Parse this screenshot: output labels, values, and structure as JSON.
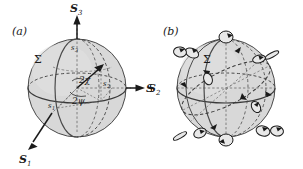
{
  "figure": {
    "background_color": "#ffffff",
    "ink_color": "#1a1a1a",
    "sphere_fill": "#d8d8d8",
    "sphere_stroke": "#4a4a4a",
    "dashed_stroke": "#3a3a3a",
    "dotted_stroke": "#6a6a6a"
  },
  "panel_a": {
    "label": "(a)",
    "surface_label": "Σ",
    "axes": [
      {
        "name": "s3-axis",
        "label": "S",
        "subscript": "3",
        "direction": "up"
      },
      {
        "name": "s2-axis",
        "label": "S",
        "subscript": "2",
        "direction": "right"
      },
      {
        "name": "s1-axis",
        "label": "S",
        "subscript": "1",
        "direction": "lower-left"
      }
    ],
    "component_labels": [
      {
        "name": "s3-component",
        "label": "s",
        "subscript": "3"
      },
      {
        "name": "s2-component",
        "label": "s",
        "subscript": "2"
      },
      {
        "name": "s1-component",
        "label": "s",
        "subscript": "1"
      }
    ],
    "angles": [
      {
        "name": "angle-2chi",
        "label": "2χ"
      },
      {
        "name": "angle-2psi",
        "label": "2ψ"
      }
    ],
    "sphere": {
      "cx": 77,
      "cy": 88,
      "r": 49
    },
    "state_point": {
      "x": 101,
      "y": 67
    }
  },
  "panel_b": {
    "label": "(b)",
    "surface_label": "Σ",
    "sphere": {
      "cx": 226,
      "cy": 88,
      "r": 49
    },
    "axis_fragment": {
      "label": "S",
      "subscript": "2"
    },
    "markers": [
      {
        "name": "polarization-circular-north",
        "type": "circle",
        "cx": 226,
        "cy": 37,
        "rx": 7.0,
        "ry": 6.0,
        "rot": 0
      },
      {
        "name": "polarization-circular-south",
        "type": "circle",
        "cx": 226,
        "cy": 140,
        "rx": 7.0,
        "ry": 6.0,
        "rot": 0
      },
      {
        "name": "polarization-linear-west",
        "type": "linear",
        "cx": 180,
        "cy": 136,
        "rx": 7.5,
        "ry": 2.2,
        "rot": -30
      },
      {
        "name": "polarization-linear-east",
        "type": "linear",
        "cx": 272,
        "cy": 55,
        "rx": 7.5,
        "ry": 2.2,
        "rot": -28
      },
      {
        "name": "polarization-ellipse-nw",
        "type": "ellipse",
        "cx": 192,
        "cy": 53,
        "rx": 7.0,
        "ry": 4.5,
        "rot": 25
      },
      {
        "name": "polarization-ellipse-ne",
        "type": "ellipse",
        "cx": 259,
        "cy": 59,
        "rx": 6.5,
        "ry": 3.8,
        "rot": -15
      },
      {
        "name": "polarization-ellipse-w",
        "type": "ellipse",
        "cx": 208,
        "cy": 79,
        "rx": 6.0,
        "ry": 4.2,
        "rot": 70
      },
      {
        "name": "polarization-ellipse-e",
        "type": "ellipse",
        "cx": 256,
        "cy": 107,
        "rx": 6.0,
        "ry": 4.2,
        "rot": 60
      },
      {
        "name": "polarization-ellipse-sw",
        "type": "ellipse",
        "cx": 200,
        "cy": 133,
        "rx": 6.5,
        "ry": 4.5,
        "rot": -25
      },
      {
        "name": "polarization-ellipse-se",
        "type": "ellipse",
        "cx": 263,
        "cy": 131,
        "rx": 7.0,
        "ry": 5.0,
        "rot": 15
      },
      {
        "name": "polarization-ellipse-far-w",
        "type": "ellipse",
        "cx": 180,
        "cy": 52,
        "rx": 6.5,
        "ry": 5.0,
        "rot": 10
      },
      {
        "name": "polarization-ellipse-far-e",
        "type": "ellipse",
        "cx": 277,
        "cy": 131,
        "rx": 6.5,
        "ry": 5.0,
        "rot": 10
      }
    ]
  }
}
